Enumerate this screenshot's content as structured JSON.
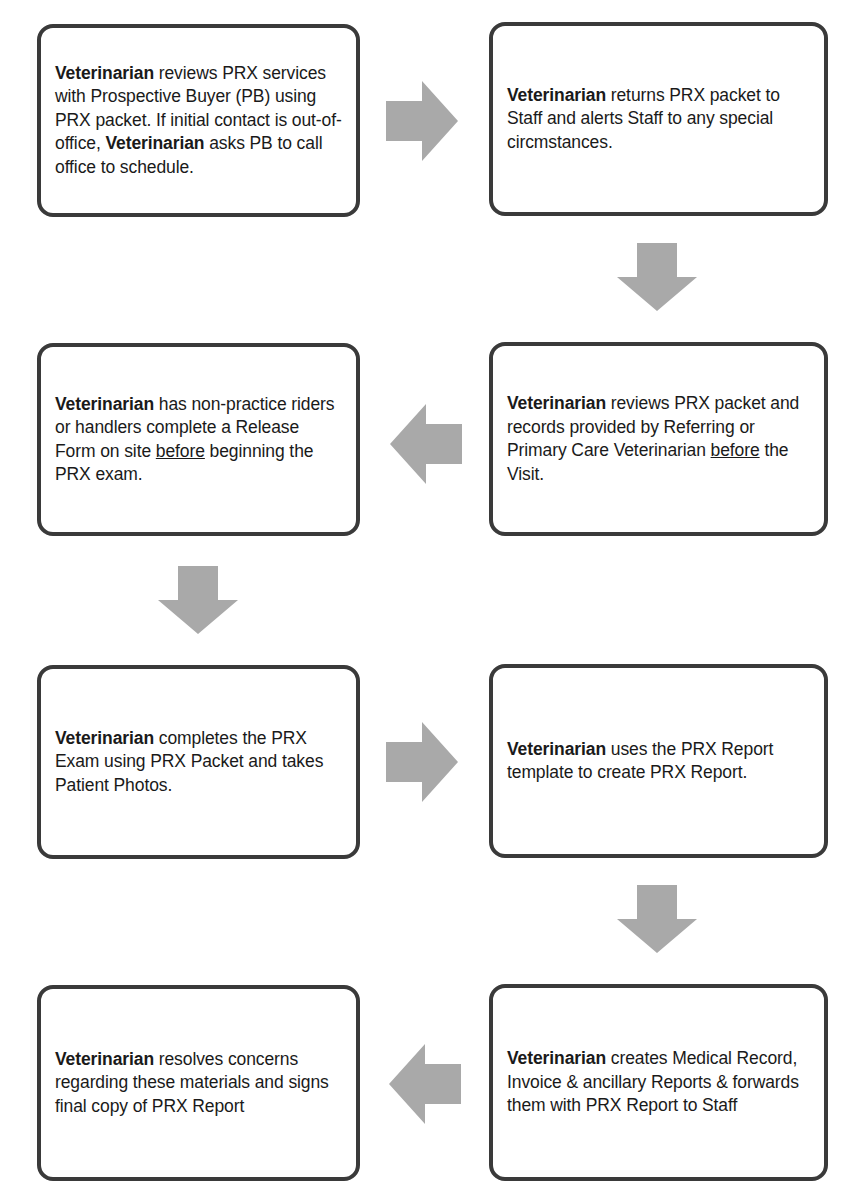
{
  "diagram": {
    "type": "process-flowchart",
    "actor": "Veterinarian",
    "arrow_color": "#a9a9a9",
    "border_color": "#3a3a3a",
    "steps": [
      {
        "id": 1,
        "segments": [
          {
            "t": "Veterinarian",
            "b": true
          },
          {
            "t": " reviews PRX services with Prospective Buyer (PB) using PRX packet. If initial contact is out-of-office, "
          },
          {
            "t": "Veterinarian",
            "b": true
          },
          {
            "t": " asks PB to call office to schedule."
          }
        ]
      },
      {
        "id": 2,
        "segments": [
          {
            "t": "Veterinarian",
            "b": true
          },
          {
            "t": " returns PRX packet to Staff and alerts Staff to any special circmstances."
          }
        ]
      },
      {
        "id": 3,
        "segments": [
          {
            "t": "Veterinarian",
            "b": true
          },
          {
            "t": " reviews PRX packet and records provided by Referring or Primary Care Veterinarian "
          },
          {
            "t": "before",
            "u": true
          },
          {
            "t": " the Visit."
          }
        ]
      },
      {
        "id": 4,
        "segments": [
          {
            "t": "Veterinarian",
            "b": true
          },
          {
            "t": " has non-practice riders or handlers complete a Release Form on site "
          },
          {
            "t": "before",
            "u": true
          },
          {
            "t": " beginning the PRX exam."
          }
        ]
      },
      {
        "id": 5,
        "segments": [
          {
            "t": "Veterinarian",
            "b": true
          },
          {
            "t": " completes the PRX Exam using PRX Packet and takes Patient Photos."
          }
        ]
      },
      {
        "id": 6,
        "segments": [
          {
            "t": "Veterinarian",
            "b": true
          },
          {
            "t": " uses the PRX Report template to create PRX Report."
          }
        ]
      },
      {
        "id": 7,
        "segments": [
          {
            "t": "Veterinarian",
            "b": true
          },
          {
            "t": " creates Medical Record, Invoice & ancillary Reports & forwards them with PRX Report to Staff"
          }
        ]
      },
      {
        "id": 8,
        "segments": [
          {
            "t": "Veterinarian",
            "b": true
          },
          {
            "t": " resolves concerns regarding these materials and signs final copy of PRX Report"
          }
        ]
      }
    ],
    "arrows": [
      {
        "from": 1,
        "to": 2,
        "direction": "right"
      },
      {
        "from": 2,
        "to": 3,
        "direction": "down"
      },
      {
        "from": 3,
        "to": 4,
        "direction": "left"
      },
      {
        "from": 4,
        "to": 5,
        "direction": "down"
      },
      {
        "from": 5,
        "to": 6,
        "direction": "right"
      },
      {
        "from": 6,
        "to": 7,
        "direction": "down"
      },
      {
        "from": 7,
        "to": 8,
        "direction": "left"
      }
    ]
  }
}
